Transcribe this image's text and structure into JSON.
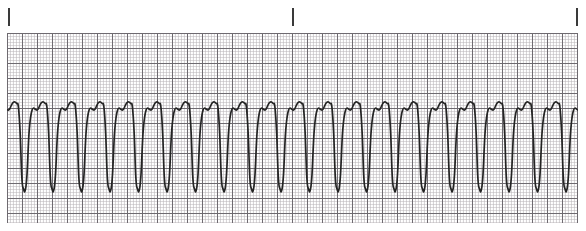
{
  "strip": {
    "title": "ECG Rhythm Strip",
    "rhythm_label": "monomorphic wide-complex tachycardia",
    "paper": {
      "background_color": "#ffffff",
      "fine_grid_color": "#b9b4b8",
      "bold_grid_color": "#6e6a70",
      "fine_grid_spacing_px": 3,
      "bold_grid_spacing_px": 15,
      "grid_left_px": 7,
      "grid_top_px": 33,
      "grid_width_px": 571,
      "grid_height_px": 190
    },
    "trace": {
      "color": "#242424",
      "line_width_px": 1.7,
      "baseline_y_px": 110,
      "peak_y_px": 102,
      "trough_y_px": 190,
      "complex_count": 20,
      "first_peak_x_px": 15,
      "complex_spacing_px": 28.5
    },
    "interval_ticks": {
      "color": "#3a3a3a",
      "top_px": 8,
      "height_px": 18,
      "width_px": 2,
      "positions_px": [
        8,
        292,
        576
      ],
      "count": 3
    }
  },
  "chart_data": {
    "type": "line",
    "xlabel": "",
    "ylabel": "",
    "grid": true,
    "legend": "none",
    "x_unit": "seconds",
    "y_unit": "millivolts",
    "paper_speed_mm_per_s": 25,
    "gain_mm_per_mV": 10,
    "small_box_mm": 1,
    "large_box_mm": 5,
    "interval_marker_seconds": 3,
    "annotations": [
      "3-second interval markers above the strip",
      "wide bizarre QRS complexes, no discernible P waves",
      "regular rapid rhythm"
    ],
    "series": [
      {
        "name": "Lead II rhythm strip",
        "complex_count": 20,
        "rate_bpm": 158,
        "morphology": "tall rounded upright deflection followed by deep narrow negative deflection",
        "complex_template_points": [
          {
            "t": 0.0,
            "mv": 0.02
          },
          {
            "t": 0.06,
            "mv": 0.05
          },
          {
            "t": 0.14,
            "mv": 0.55
          },
          {
            "t": 0.2,
            "mv": 0.82
          },
          {
            "t": 0.26,
            "mv": 0.86
          },
          {
            "t": 0.32,
            "mv": 0.7
          },
          {
            "t": 0.38,
            "mv": 0.3
          },
          {
            "t": 0.44,
            "mv": -0.45
          },
          {
            "t": 0.5,
            "mv": -1.35
          },
          {
            "t": 0.56,
            "mv": -1.58
          },
          {
            "t": 0.62,
            "mv": -1.6
          },
          {
            "t": 0.68,
            "mv": -1.3
          },
          {
            "t": 0.76,
            "mv": -0.4
          },
          {
            "t": 0.86,
            "mv": 0.0
          },
          {
            "t": 1.0,
            "mv": 0.02
          }
        ]
      }
    ]
  }
}
